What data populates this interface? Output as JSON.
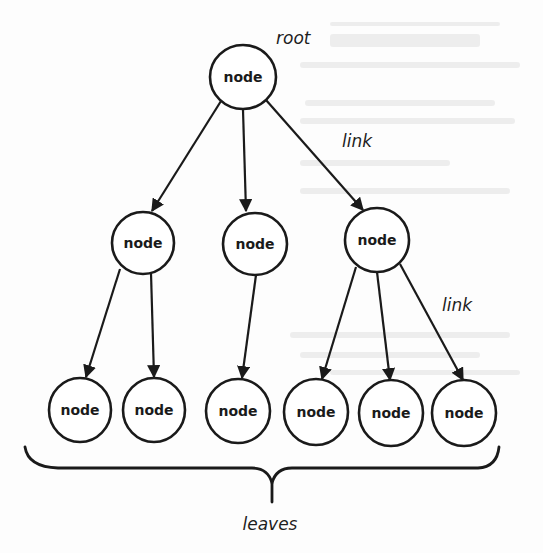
{
  "diagram": {
    "type": "tree",
    "colors": {
      "stroke": "#1a1a1a",
      "node_fill": "#ffffff",
      "background": "#fdfdfd"
    },
    "labels": {
      "root": "root",
      "link_upper": "link",
      "link_lower": "link",
      "leaves": "leaves"
    },
    "nodes": [
      {
        "id": "root",
        "label": "node",
        "level": 0,
        "cx": 243,
        "cy": 77
      },
      {
        "id": "mid-1",
        "label": "node",
        "level": 1,
        "cx": 143,
        "cy": 243
      },
      {
        "id": "mid-2",
        "label": "node",
        "level": 1,
        "cx": 255,
        "cy": 244
      },
      {
        "id": "mid-3",
        "label": "node",
        "level": 1,
        "cx": 377,
        "cy": 240
      },
      {
        "id": "leaf-1",
        "label": "node",
        "level": 2,
        "cx": 80,
        "cy": 410
      },
      {
        "id": "leaf-2",
        "label": "node",
        "level": 2,
        "cx": 154,
        "cy": 410
      },
      {
        "id": "leaf-3",
        "label": "node",
        "level": 2,
        "cx": 238,
        "cy": 411
      },
      {
        "id": "leaf-4",
        "label": "node",
        "level": 2,
        "cx": 316,
        "cy": 412
      },
      {
        "id": "leaf-5",
        "label": "node",
        "level": 2,
        "cx": 391,
        "cy": 413
      },
      {
        "id": "leaf-6",
        "label": "node",
        "level": 2,
        "cx": 464,
        "cy": 413
      }
    ],
    "edges": [
      {
        "from": "root",
        "to": "mid-1"
      },
      {
        "from": "root",
        "to": "mid-2"
      },
      {
        "from": "root",
        "to": "mid-3"
      },
      {
        "from": "mid-1",
        "to": "leaf-1"
      },
      {
        "from": "mid-1",
        "to": "leaf-2"
      },
      {
        "from": "mid-2",
        "to": "leaf-3"
      },
      {
        "from": "mid-3",
        "to": "leaf-4"
      },
      {
        "from": "mid-3",
        "to": "leaf-5"
      },
      {
        "from": "mid-3",
        "to": "leaf-6"
      }
    ]
  }
}
